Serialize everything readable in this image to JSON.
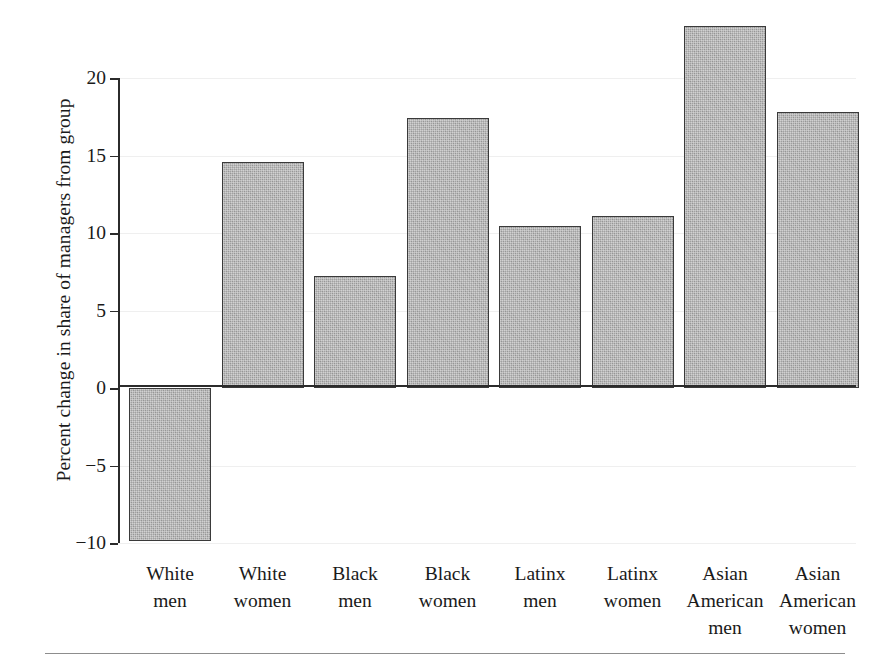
{
  "chart_data": {
    "type": "bar",
    "title": "",
    "subtitle": "",
    "xlabel": "",
    "ylabel": "Percent change in share of managers from group",
    "categories": [
      "White men",
      "White women",
      "Black men",
      "Black women",
      "Latinx men",
      "Latinx women",
      "Asian American men",
      "Asian American women"
    ],
    "category_lines": [
      [
        "White",
        "men"
      ],
      [
        "White",
        "women"
      ],
      [
        "Black",
        "men"
      ],
      [
        "Black",
        "women"
      ],
      [
        "Latinx",
        "men"
      ],
      [
        "Latinx",
        "women"
      ],
      [
        "Asian",
        "American",
        "men"
      ],
      [
        "Asian",
        "American",
        "women"
      ]
    ],
    "values": [
      -9.9,
      14.6,
      7.25,
      17.4,
      10.45,
      11.1,
      23.35,
      17.8
    ],
    "ylim": [
      -10,
      20
    ],
    "yticks": [
      20,
      15,
      10,
      5,
      0,
      -5,
      -10
    ],
    "ytick_labels": [
      "20",
      "15",
      "10",
      "5",
      "0",
      "−5",
      "−10"
    ],
    "grid": "horizontal-faint",
    "legend": "none",
    "bar_fill_color": "#9d9d9d",
    "bar_edge_color": "#3a3a3a",
    "axis_color": "#2b2b2b",
    "background_color": "#ffffff",
    "annotations": []
  },
  "figure": {
    "bottom_rule_visible": "true"
  }
}
